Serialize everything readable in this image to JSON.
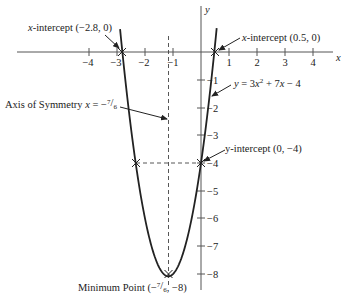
{
  "chart_data": {
    "type": "line",
    "title": "",
    "equation": "y = 3x² + 7x − 4",
    "xlabel": "x",
    "ylabel": "y",
    "xlim": [
      -4.5,
      4.8
    ],
    "ylim": [
      -8.5,
      1.5
    ],
    "grid": false,
    "x_ticks": [
      -4,
      -3,
      -2,
      -1,
      1,
      2,
      3,
      4
    ],
    "x_tick_labels": [
      "−4",
      "−3",
      "−2",
      "−1",
      "1",
      "2",
      "3",
      "4"
    ],
    "y_ticks": [
      -1,
      -2,
      -3,
      -4,
      -5,
      -6,
      -7,
      -8
    ],
    "y_tick_labels": [
      "−1",
      "−2",
      "−3",
      "−4",
      "−5",
      "−6",
      "−7",
      "−8"
    ],
    "series": [
      {
        "name": "y = 3x^2 + 7x - 4",
        "x": [
          -2.89,
          -2.8,
          -2.5,
          -2.333,
          -2,
          -1.5,
          -1.167,
          -1,
          -0.5,
          0,
          0.5,
          0.56
        ],
        "y": [
          0.8,
          0.12,
          -2.75,
          -4,
          -6,
          -7.75,
          -8.08,
          -8,
          -6.75,
          -4,
          0.25,
          0.86
        ]
      }
    ],
    "key_points": [
      {
        "name": "x-intercept",
        "x": -2.8,
        "y": 0
      },
      {
        "name": "x-intercept",
        "x": 0.5,
        "y": 0
      },
      {
        "name": "y-intercept",
        "x": 0,
        "y": -4
      },
      {
        "name": "symmetric point",
        "x": -2.333,
        "y": -4
      },
      {
        "name": "minimum point",
        "x": -1.167,
        "y": -8
      }
    ],
    "axis_of_symmetry": -1.1667,
    "annotations": [
      "x-intercept (−2.8, 0)",
      "x-intercept (0.5, 0)",
      "y = 3x² + 7x − 4",
      "Axis of Symmetry x = −⁷⁄₆",
      "y-intercept (0, −4)",
      "Minimum Point (−⁷⁄₆, −8)"
    ]
  },
  "labels": {
    "x_axis": "x",
    "y_axis": "y",
    "x_int_left_prefix": "x",
    "x_int_left_rest": "-intercept (−2.8, 0)",
    "x_int_right_prefix": "x",
    "x_int_right_rest": "-intercept (0.5, 0)",
    "equation_y": "y",
    "equation_eq": " = 3",
    "equation_x1": "x",
    "equation_sup": "2",
    "equation_mid": " + 7",
    "equation_x2": "x",
    "equation_end": " − 4",
    "axis_sym_text": "Axis of Symmetry ",
    "axis_sym_x": "x",
    "axis_sym_eq": " = −",
    "axis_sym_num": "7",
    "axis_sym_slash": "/",
    "axis_sym_den": "6",
    "y_int": "y-intercept (0, −4)",
    "min_text": "Minimum Point (−",
    "min_num": "7",
    "min_slash": "/",
    "min_den": "6",
    "min_end": ", −8)"
  }
}
